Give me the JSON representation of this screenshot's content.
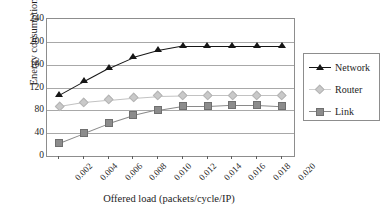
{
  "chart_data": {
    "type": "line",
    "title": "",
    "xlabel": "Offered load (packets/cycle/IP)",
    "ylabel": "Energy consumption (µJ)",
    "x": [
      0.002,
      0.004,
      0.006,
      0.008,
      0.01,
      0.012,
      0.014,
      0.016,
      0.018,
      0.02
    ],
    "xtick_labels": [
      "0.002",
      "0.004",
      "0.006",
      "0.008",
      "0.010",
      "0.012",
      "0.014",
      "0.016",
      "0.018",
      "0.020"
    ],
    "ytick_labels": [
      "0",
      "40",
      "80",
      "120",
      "160",
      "200",
      "240"
    ],
    "ytick_values": [
      0,
      40,
      80,
      120,
      160,
      200,
      240
    ],
    "ylim": [
      0,
      240
    ],
    "xlim": [
      0.001,
      0.021
    ],
    "grid": "horizontal",
    "legend_position": "right",
    "series": [
      {
        "name": "Network",
        "marker": "triangle",
        "color": "#161616",
        "values": [
          107,
          131,
          154,
          173,
          185,
          193,
          193,
          193,
          193,
          193
        ]
      },
      {
        "name": "Router",
        "marker": "diamond",
        "color": "#c9c9c9",
        "values": [
          87,
          94,
          98,
          102,
          105,
          106,
          106,
          106,
          106,
          106
        ]
      },
      {
        "name": "Link",
        "marker": "square",
        "color": "#8c8c8c",
        "values": [
          23,
          40,
          57,
          71,
          81,
          88,
          88,
          90,
          90,
          88
        ]
      }
    ]
  },
  "legend": {
    "items": [
      {
        "label": "Network"
      },
      {
        "label": "Router"
      },
      {
        "label": "Link"
      }
    ]
  },
  "colors": {
    "network": "#161616",
    "router": "#c9c9c9",
    "link": "#8c8c8c",
    "grid": "#a8a8a8",
    "frame": "#8d8d8d",
    "text": "#1d1d1d",
    "background": "#ffffff"
  }
}
